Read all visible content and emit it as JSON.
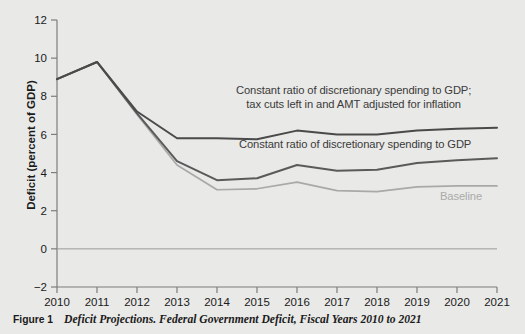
{
  "figure": {
    "caption_number": "Figure 1",
    "caption_text": "Deficit Projections. Federal Government Deficit, Fiscal Years 2010 to 2021",
    "background_color": "#e9e9e7"
  },
  "annotations": {
    "upper_line1": "Constant ratio of discretionary spending to GDP;",
    "upper_line2": "tax cuts left in and AMT adjusted for inflation",
    "middle": "Constant ratio of discretionary spending to GDP",
    "baseline": "Baseline"
  },
  "chart_data": {
    "type": "line",
    "title": "Deficit Projections. Federal Government Deficit, Fiscal Years 2010 to 2021",
    "xlabel": "",
    "ylabel": "Deficit (percent of GDP)",
    "x": [
      2010,
      2011,
      2012,
      2013,
      2014,
      2015,
      2016,
      2017,
      2018,
      2019,
      2020,
      2021
    ],
    "categories": [
      "2010",
      "2011",
      "2012",
      "2013",
      "2014",
      "2015",
      "2016",
      "2017",
      "2018",
      "2019",
      "2020",
      "2021"
    ],
    "xlim": [
      2010,
      2021
    ],
    "ylim": [
      -2,
      12
    ],
    "yticks": [
      -2,
      0,
      2,
      4,
      6,
      8,
      10,
      12
    ],
    "ytick_labels": [
      "−2",
      "0",
      "2",
      "4",
      "6",
      "8",
      "10",
      "12"
    ],
    "xticks": [
      2010,
      2011,
      2012,
      2013,
      2014,
      2015,
      2016,
      2017,
      2018,
      2019,
      2020,
      2021
    ],
    "grid": false,
    "legend_position": "inline-annotations",
    "zero_line": 0,
    "series": [
      {
        "name": "Constant ratio of discretionary spending to GDP; tax cuts left in and AMT adjusted for inflation",
        "color": "#4a4a4a",
        "values": [
          8.9,
          9.8,
          7.2,
          5.8,
          5.8,
          5.75,
          6.2,
          6.0,
          6.0,
          6.2,
          6.3,
          6.35
        ]
      },
      {
        "name": "Constant ratio of discretionary spending to GDP",
        "color": "#5a5a5a",
        "values": [
          8.9,
          9.8,
          7.1,
          4.6,
          3.6,
          3.7,
          4.4,
          4.1,
          4.15,
          4.5,
          4.65,
          4.75
        ]
      },
      {
        "name": "Baseline",
        "color": "#a9a9a9",
        "values": [
          8.9,
          9.8,
          7.05,
          4.4,
          3.1,
          3.15,
          3.5,
          3.05,
          3.0,
          3.25,
          3.3,
          3.3
        ]
      }
    ]
  },
  "axis": {
    "y_title": "Deficit (percent of GDP)"
  }
}
